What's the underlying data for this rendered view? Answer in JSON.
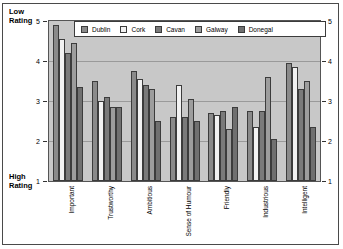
{
  "axis_labels": {
    "top_left": "Low\nRating",
    "top_left_line1": "Low",
    "top_left_line2": "Rating",
    "bottom_left_line1": "High",
    "bottom_left_line2": "Rating"
  },
  "legend": {
    "items": [
      {
        "label": "Dublin",
        "color": "#8a8a8a"
      },
      {
        "label": "Cork",
        "color": "#f2f2f2"
      },
      {
        "label": "Cavan",
        "color": "#7a7a7a"
      },
      {
        "label": "Galway",
        "color": "#9d9d9d"
      },
      {
        "label": "Donegal",
        "color": "#707070"
      }
    ]
  },
  "chart_data": {
    "type": "bar",
    "title": "",
    "xlabel": "",
    "ylabel": "Rating",
    "ylim": [
      1,
      5
    ],
    "yticks": [
      1,
      2,
      3,
      4,
      5
    ],
    "ytick_labels": [
      "1",
      "2",
      "3",
      "4",
      "5"
    ],
    "grid": true,
    "legend_position": "top",
    "y_axis_note_top": "Low Rating",
    "y_axis_note_bottom": "High Rating",
    "categories": [
      "Important",
      "Trustworthy",
      "Ambitious",
      "Sense of Humour",
      "Friendly",
      "Industrious",
      "Intelligent"
    ],
    "series": [
      {
        "name": "Dublin",
        "color": "#8a8a8a",
        "values": [
          4.9,
          3.5,
          3.75,
          2.6,
          2.7,
          2.75,
          3.95
        ]
      },
      {
        "name": "Cork",
        "color": "#f2f2f2",
        "values": [
          4.55,
          3.0,
          3.55,
          3.4,
          2.65,
          2.35,
          3.85
        ]
      },
      {
        "name": "Cavan",
        "color": "#7a7a7a",
        "values": [
          4.2,
          3.1,
          3.4,
          2.6,
          2.75,
          2.75,
          3.3
        ]
      },
      {
        "name": "Galway",
        "color": "#9d9d9d",
        "values": [
          4.45,
          2.85,
          3.3,
          3.05,
          2.3,
          3.6,
          3.5
        ]
      },
      {
        "name": "Donegal",
        "color": "#707070",
        "values": [
          3.35,
          2.85,
          2.5,
          2.5,
          2.85,
          2.05,
          2.35
        ]
      }
    ]
  }
}
